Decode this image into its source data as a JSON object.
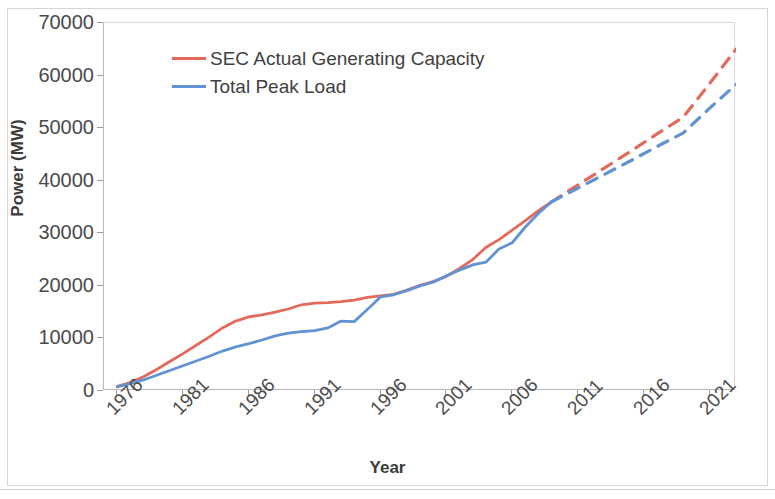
{
  "chart_data": {
    "type": "line",
    "title": "",
    "xlabel": "Year",
    "ylabel": "Power (MW)",
    "xlim": [
      1975,
      2023
    ],
    "ylim": [
      0,
      70000
    ],
    "grid": false,
    "legend_position": "top-left-inside",
    "x_tick_labels": [
      "1976",
      "1981",
      "1986",
      "1991",
      "1996",
      "2001",
      "2006",
      "2011",
      "2016",
      "2021"
    ],
    "x_ticks": [
      1976,
      1981,
      1986,
      1991,
      1996,
      2001,
      2006,
      2011,
      2016,
      2021
    ],
    "y_tick_labels": [
      "0",
      "10000",
      "20000",
      "30000",
      "40000",
      "50000",
      "60000",
      "70000"
    ],
    "y_ticks": [
      0,
      10000,
      20000,
      30000,
      40000,
      50000,
      60000,
      70000
    ],
    "x": [
      1976,
      1977,
      1978,
      1979,
      1980,
      1981,
      1982,
      1983,
      1984,
      1985,
      1986,
      1987,
      1988,
      1989,
      1990,
      1991,
      1992,
      1993,
      1994,
      1995,
      1996,
      1997,
      1998,
      1999,
      2000,
      2001,
      2002,
      2003,
      2004,
      2005,
      2006,
      2007,
      2008,
      2009
    ],
    "x_forecast": [
      2009,
      2011,
      2013,
      2015,
      2017,
      2019,
      2021,
      2023
    ],
    "series": [
      {
        "name": "SEC Actual Generating Capacity",
        "color": "#E3695B",
        "style": "solid",
        "values": [
          900,
          1600,
          2700,
          4100,
          5600,
          7100,
          8700,
          10300,
          12000,
          13300,
          14100,
          14500,
          15000,
          15600,
          16400,
          16700,
          16800,
          17000,
          17300,
          17800,
          18100,
          18400,
          19200,
          20100,
          20800,
          21800,
          23300,
          25000,
          27300,
          28800,
          30600,
          32400,
          34300,
          36000
        ],
        "forecast_values": [
          36000,
          39200,
          42400,
          45600,
          48900,
          52100,
          58500,
          65000
        ],
        "forecast_style": "dashed"
      },
      {
        "name": "Total Peak Load",
        "color": "#6193D2",
        "style": "solid",
        "values": [
          800,
          1400,
          2100,
          3000,
          3900,
          4800,
          5700,
          6600,
          7600,
          8400,
          9000,
          9700,
          10500,
          11000,
          11300,
          11500,
          12000,
          13300,
          13200,
          15500,
          17900,
          18300,
          19100,
          20000,
          20700,
          21900,
          23000,
          24000,
          24500,
          27000,
          28200,
          31200,
          33800,
          36000
        ],
        "forecast_values": [
          36000,
          38600,
          41200,
          43800,
          46500,
          49100,
          53800,
          58300
        ],
        "forecast_style": "dashed"
      }
    ],
    "annotations": [
      "Solid segments are historical data through 2009; dashed segments are projections to 2023."
    ]
  },
  "legend": {
    "items": [
      {
        "label": "SEC Actual Generating Capacity",
        "color": "#E3695B"
      },
      {
        "label": "Total Peak Load",
        "color": "#6193D2"
      }
    ]
  },
  "axes": {
    "y_title": "Power (MW)",
    "x_title": "Year"
  }
}
